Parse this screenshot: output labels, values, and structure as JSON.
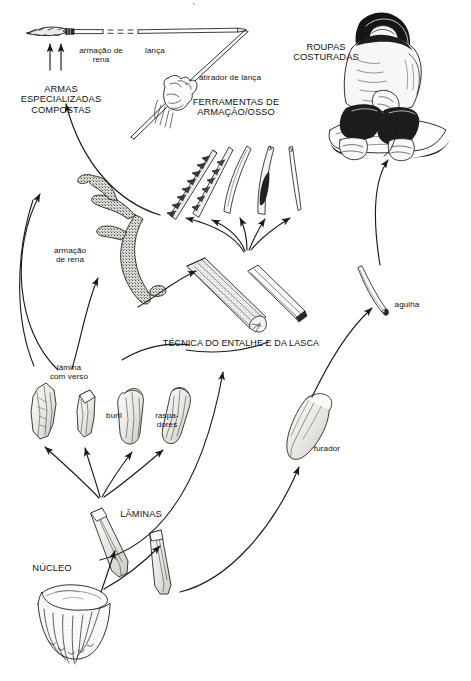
{
  "figure": {
    "kind": "flowchart-diagram",
    "language": "pt-BR",
    "background_color": "#ffffff",
    "ink_color": "#1a1a1a"
  },
  "labels": {
    "antler_frame_top": "armação de\nrena",
    "spear": "lança",
    "spear_thrower": "atirador de lança",
    "composite_weapons": "ARMAS\nESPECIALIZADAS\nCOMPOSTAS",
    "bone_tools": "FERRAMENTAS DE\nARMAÇÃO/OSSO",
    "sewn_clothes": "ROUPAS\nCOSTURADAS",
    "antler_frame_mid": "armação\nde rena",
    "groove_splinter": "TÉCNICA DO ENTALHE E DA LASCA",
    "needle": "agulha",
    "backed_blade": "lâmina\ncom verso",
    "burin": "buril",
    "scrapers": "raspa-\ndores",
    "borer": "furador",
    "blades": "LÂMINAS",
    "core": "NÚCLEO"
  },
  "objects": [
    {
      "name": "harpoon-head-with-shaft",
      "label_ref": "antler_frame_top"
    },
    {
      "name": "spear-shaft",
      "label_ref": "spear"
    },
    {
      "name": "hand-holding-atlatl",
      "label_ref": "spear_thrower"
    },
    {
      "name": "seated-figure-in-fur-parka",
      "label_ref": "sewn_clothes"
    },
    {
      "name": "barbed-harpoon-point",
      "label_ref": "bone_tools"
    },
    {
      "name": "barbed-point",
      "label_ref": "bone_tools"
    },
    {
      "name": "bone-point",
      "label_ref": "bone_tools"
    },
    {
      "name": "eyed-bone-point",
      "label_ref": "bone_tools"
    },
    {
      "name": "bone-needle",
      "label_ref": "bone_tools"
    },
    {
      "name": "reindeer-antler",
      "label_ref": "antler_frame_mid"
    },
    {
      "name": "grooved-antler-blank",
      "label_ref": "groove_splinter"
    },
    {
      "name": "antler-splinter",
      "label_ref": "groove_splinter"
    },
    {
      "name": "bone-needle-with-eye",
      "label_ref": "needle"
    },
    {
      "name": "backed-blade-tool",
      "label_ref": "backed_blade"
    },
    {
      "name": "burin-tool",
      "label_ref": "burin"
    },
    {
      "name": "end-scraper-tool",
      "label_ref": "scrapers"
    },
    {
      "name": "side-scraper-tool",
      "label_ref": "scrapers"
    },
    {
      "name": "borer-tool",
      "label_ref": "borer"
    },
    {
      "name": "blade-blank-upper",
      "label_ref": "blades"
    },
    {
      "name": "blade-blank-lower",
      "label_ref": "blades"
    },
    {
      "name": "prismatic-flint-core",
      "label_ref": "core"
    }
  ],
  "flow_arrows": [
    {
      "from": "core",
      "to": "blades"
    },
    {
      "from": "blades",
      "to": "backed_blade"
    },
    {
      "from": "blades",
      "to": "burin"
    },
    {
      "from": "blades",
      "to": "scrapers"
    },
    {
      "from": "blades",
      "to": "borer"
    },
    {
      "from": "backed_blade",
      "to": "antler_frame_mid"
    },
    {
      "from": "burin",
      "to": "groove_splinter"
    },
    {
      "from": "antler_frame_mid",
      "to": "groove_splinter"
    },
    {
      "from": "groove_splinter",
      "to": "bone_tools"
    },
    {
      "from": "bone_tools",
      "to": "composite_weapons"
    },
    {
      "from": "composite_weapons",
      "to": "antler_frame_top"
    },
    {
      "from": "borer",
      "to": "needle"
    },
    {
      "from": "needle",
      "to": "sewn_clothes"
    }
  ]
}
